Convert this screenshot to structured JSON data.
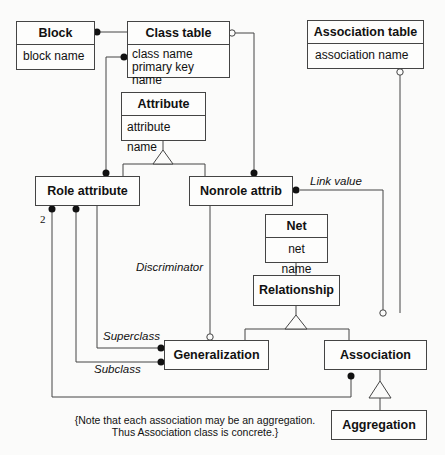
{
  "classes": {
    "block": {
      "name": "Block",
      "attributes": [
        "block name"
      ]
    },
    "class_table": {
      "name": "Class table",
      "attributes": [
        "class name",
        "primary key name"
      ]
    },
    "association_table": {
      "name": "Association table",
      "attributes": [
        "association name"
      ]
    },
    "attribute": {
      "name": "Attribute",
      "attributes": [
        "attribute name"
      ]
    },
    "role_attribute": {
      "name": "Role attribute"
    },
    "nonrole_attrib": {
      "name": "Nonrole attrib"
    },
    "net": {
      "name": "Net",
      "attributes": [
        "net name"
      ]
    },
    "relationship": {
      "name": "Relationship"
    },
    "generalization": {
      "name": "Generalization"
    },
    "association": {
      "name": "Association"
    },
    "aggregation": {
      "name": "Aggregation"
    }
  },
  "labels": {
    "link_value": "Link value",
    "discriminator": "Discriminator",
    "superclass": "Superclass",
    "subclass": "Subclass",
    "multiplicity_2": "2"
  },
  "note": {
    "line1": "{Note that each association may be an aggregation.",
    "line2": "Thus Association class is concrete.}"
  },
  "colors": {
    "line": "#444444",
    "background": "#fbfbfa"
  }
}
